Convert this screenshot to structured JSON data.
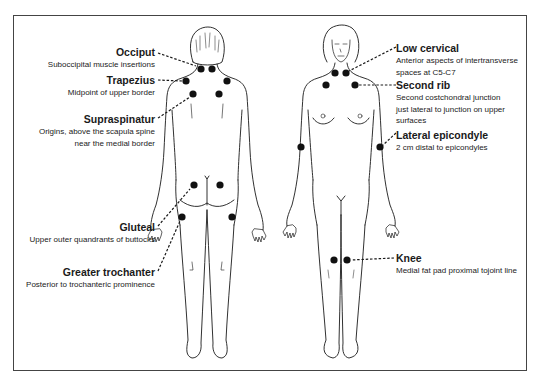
{
  "diagram": {
    "colors": {
      "border": "#444444",
      "ink": "#1a1a1a",
      "dot": "#111111"
    },
    "views": [
      {
        "name": "posterior",
        "center_x": 207
      },
      {
        "name": "anterior",
        "center_x": 341
      }
    ],
    "labels_left": [
      {
        "title": "Occiput",
        "desc": [
          "Suboccipital muscle insertions"
        ]
      },
      {
        "title": "Trapezius",
        "desc": [
          "Midpoint of upper border"
        ]
      },
      {
        "title": "Supraspinatur",
        "desc": [
          "Origins, above the scapula spine",
          "near the medial border"
        ]
      },
      {
        "title": "Gluteal",
        "desc": [
          "Upper outer quandrants of buttocks"
        ]
      },
      {
        "title": "Greater trochanter",
        "desc": [
          "Posterior to trochanteric prominence"
        ]
      }
    ],
    "labels_right": [
      {
        "title": "Low cervical",
        "desc": [
          "Anterior aspects of intertransverse",
          "spaces at C5-C7"
        ]
      },
      {
        "title": "Second rib",
        "desc": [
          "Second costchondral junction",
          "just lateral to junction on upper",
          "surfaces"
        ]
      },
      {
        "title": "Lateral epicondyle",
        "desc": [
          "2 cm distal to epicondyles"
        ]
      },
      {
        "title": "Knee",
        "desc": [
          "Medial fat pad proximal tojoint line"
        ]
      }
    ],
    "tender_points": {
      "posterior": [
        {
          "site": "Occiput",
          "x": [
            201,
            212
          ],
          "y": 69
        },
        {
          "site": "Trapezius",
          "x": [
            186,
            227
          ],
          "y": 81
        },
        {
          "site": "Supraspinatur",
          "x": [
            193,
            219
          ],
          "y": 94
        },
        {
          "site": "Gluteal",
          "x": [
            194,
            220
          ],
          "y": 185
        },
        {
          "site": "Greater trochanter",
          "x": [
            182,
            232
          ],
          "y": 217
        }
      ],
      "anterior": [
        {
          "site": "Low cervical",
          "x": [
            335,
            346
          ],
          "y": 73
        },
        {
          "site": "Second rib",
          "x": [
            326,
            355
          ],
          "y": 85
        },
        {
          "site": "Lateral epicondyle",
          "x": [
            301,
            380
          ],
          "y": 147
        },
        {
          "site": "Knee",
          "x": [
            334,
            347
          ],
          "y": 260
        }
      ]
    }
  }
}
